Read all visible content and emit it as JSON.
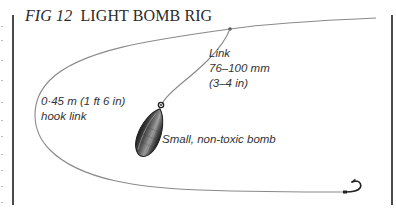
{
  "figure": {
    "number_label": "FIG 12",
    "title": "LIGHT BOMB RIG"
  },
  "labels": {
    "link": [
      "Link",
      "76–100 mm",
      "(3–4 in)"
    ],
    "hook_link": [
      "0·45 m (1 ft 6 in)",
      "hook link"
    ],
    "bomb": "Small, non-toxic bomb"
  },
  "components": [
    {
      "name": "main-line",
      "description": "Main line running from top right"
    },
    {
      "name": "swivel",
      "description": "Junction point of link on main line"
    },
    {
      "name": "link",
      "description": "Short link to bomb"
    },
    {
      "name": "bomb",
      "description": "Small, non-toxic bomb (lead weight)"
    },
    {
      "name": "hook-link",
      "description": "0·45 m hook link looping to the hook"
    },
    {
      "name": "hook",
      "description": "Fishing hook at end of hook link"
    }
  ],
  "colors": {
    "line": "#8a8a8a",
    "frame": "#4a4a4a",
    "text": "#333333",
    "bomb_dark": "#2b2b2b",
    "bomb_light": "#9a9a9a"
  }
}
